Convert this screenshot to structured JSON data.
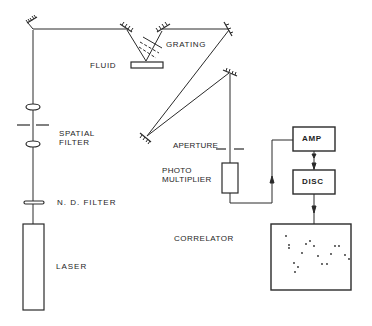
{
  "labels": {
    "fluid": "FLUID",
    "grating": "GRATING",
    "spatial_filter": "SPATIAL\nFILTER",
    "aperture": "APERTURE",
    "photomultiplier": "PHOTO\nMULTIPLIER",
    "nd_filter": "N. D. FILTER",
    "laser": "LASER",
    "correlator": "CORRELATOR",
    "amp": "AMP",
    "disc": "DISC"
  },
  "components": [
    {
      "id": "laser",
      "type": "source"
    },
    {
      "id": "nd-filter",
      "type": "filter"
    },
    {
      "id": "lens-1",
      "type": "lens"
    },
    {
      "id": "spatial-filter",
      "type": "pinhole"
    },
    {
      "id": "lens-2",
      "type": "lens"
    },
    {
      "id": "mirror-1",
      "type": "mirror"
    },
    {
      "id": "mirror-2",
      "type": "mirror"
    },
    {
      "id": "fluid-cell",
      "type": "sample"
    },
    {
      "id": "grating",
      "type": "grating"
    },
    {
      "id": "mirror-3",
      "type": "mirror"
    },
    {
      "id": "mirror-4",
      "type": "mirror"
    },
    {
      "id": "mirror-5",
      "type": "mirror"
    },
    {
      "id": "aperture",
      "type": "aperture"
    },
    {
      "id": "photomultiplier",
      "type": "detector"
    },
    {
      "id": "amp",
      "type": "electronics"
    },
    {
      "id": "disc",
      "type": "electronics"
    },
    {
      "id": "correlator",
      "type": "display"
    }
  ],
  "correlator_plot_points": [
    [
      286,
      236
    ],
    [
      289,
      245
    ],
    [
      289,
      248
    ],
    [
      294,
      263
    ],
    [
      295,
      272
    ],
    [
      298,
      267
    ],
    [
      302,
      253
    ],
    [
      306,
      244
    ],
    [
      310,
      241
    ],
    [
      314,
      246
    ],
    [
      318,
      256
    ],
    [
      322,
      264
    ],
    [
      327,
      264
    ],
    [
      331,
      254
    ],
    [
      335,
      246
    ],
    [
      339,
      246
    ],
    [
      345,
      255
    ],
    [
      349,
      259
    ]
  ]
}
